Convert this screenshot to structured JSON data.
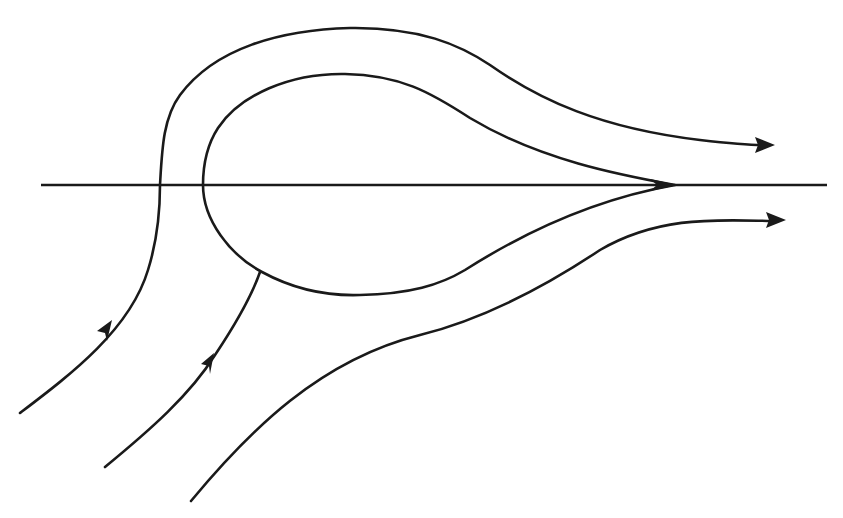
{
  "diagram": {
    "type": "phase-portrait flow diagram",
    "stroke_color": "#1a1a1a",
    "background_color": "#ffffff",
    "axis": {
      "label": "",
      "orientation": "horizontal"
    },
    "elements": [
      {
        "id": "horizontal-axis",
        "kind": "line"
      },
      {
        "id": "outer-trajectory",
        "kind": "curve",
        "arrows": [
          "incoming-lower-left",
          "outgoing-right-upper"
        ]
      },
      {
        "id": "homoclinic-loop",
        "kind": "closed-loop-with-cusp",
        "cusp": "on-axis-right"
      },
      {
        "id": "inner-incoming-trajectory",
        "kind": "curve",
        "arrows": [
          "incoming-lower-left"
        ],
        "terminates_on": "homoclinic-loop"
      },
      {
        "id": "lower-trajectory",
        "kind": "curve",
        "arrows": [
          "outgoing-right-lower"
        ]
      }
    ],
    "text_labels": []
  }
}
